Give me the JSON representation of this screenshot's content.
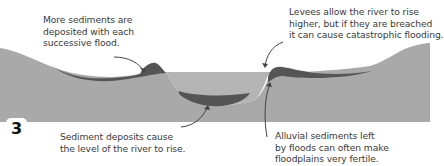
{
  "diagram": {
    "step_number": "3",
    "colors": {
      "background": "#ffffff",
      "ground": "#a9a9a9",
      "water": "#b3b3b3",
      "sediment": "#555555",
      "text": "#3a3a3a",
      "arrow": "#444444"
    },
    "annotations": [
      {
        "id": "successive-flood",
        "lines": [
          "More sediments are",
          "deposited with each",
          "successive flood."
        ]
      },
      {
        "id": "levees",
        "lines": [
          "Levees allow the river to rise",
          "higher, but if they are breached",
          "it can cause catastrophic flooding."
        ]
      },
      {
        "id": "river-level",
        "lines": [
          "Sediment deposits cause",
          "the level of the river to rise."
        ]
      },
      {
        "id": "alluvial",
        "lines": [
          "Alluvial sediments left",
          "by floods can often make",
          "floodplains very fertile."
        ]
      }
    ]
  }
}
